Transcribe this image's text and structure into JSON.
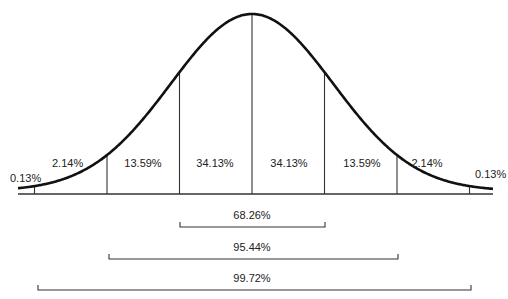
{
  "chart_data": {
    "type": "area",
    "title": "",
    "xlabel": "",
    "ylabel": "",
    "categories": [
      "< -3σ",
      "-3σ to -2σ",
      "-2σ to -1σ",
      "-1σ to mean",
      "mean to +1σ",
      "+1σ to +2σ",
      "+2σ to +3σ",
      "> +3σ"
    ],
    "values": [
      0.13,
      2.14,
      13.59,
      34.13,
      34.13,
      13.59,
      2.14,
      0.13
    ],
    "segment_labels": [
      "0.13%",
      "2.14%",
      "13.59%",
      "34.13%",
      "34.13%",
      "13.59%",
      "2.14%",
      "0.13%"
    ],
    "ranges": [
      {
        "label": "68.26%",
        "from_sigma": -1,
        "to_sigma": 1,
        "value": 68.26
      },
      {
        "label": "95.44%",
        "from_sigma": -2,
        "to_sigma": 2,
        "value": 95.44
      },
      {
        "label": "99.72%",
        "from_sigma": -3,
        "to_sigma": 3,
        "value": 99.72
      }
    ],
    "divisions_sigma": [
      -3,
      -2,
      -1,
      0,
      1,
      2,
      3
    ],
    "grid": false,
    "legend": null
  }
}
